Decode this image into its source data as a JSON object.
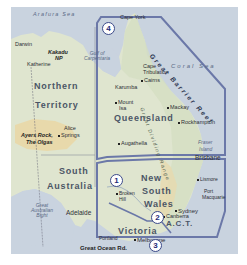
{
  "map": {
    "title": "Eastern & Central Australia regions",
    "colors": {
      "sea": "#c9d3df",
      "land": "#dfe5cf",
      "land_green": "#d2dcc2",
      "desert": "#ead7a4",
      "region_outline": "#6b78a8",
      "badge_text": "#1e2a78"
    },
    "seas": {
      "arafura": "Arafura Sea",
      "coral": "Coral Sea",
      "gulf": "Gulf of Carpentaria",
      "bight": "Great Australian Bight"
    },
    "states": {
      "nt_line1": "Northern",
      "nt_line2": "Territory",
      "qld": "Queensland",
      "sa_line1": "South",
      "sa_line2": "Australia",
      "nsw_line1": "New",
      "nsw_line2": "South",
      "nsw_line3": "Wales",
      "vic": "Victoria",
      "act": "A.C.T."
    },
    "cities": {
      "darwin": "Darwin",
      "katherine": "Katherine",
      "alice_springs_1": "Alice",
      "alice_springs_2": "Springs",
      "cape_york": "Cape York",
      "cape_tribulation_1": "Cape",
      "cape_tribulation_2": "Tribulation",
      "cairns": "Cairns",
      "karumba": "Karumba",
      "mount_isa_1": "Mount",
      "mount_isa_2": "Isa",
      "mackay": "Mackay",
      "rockhampton": "Rockhampton",
      "augathella": "Augathella",
      "fraser_island_1": "Fraser",
      "fraser_island_2": "Island",
      "brisbane": "Brisbane",
      "lismore": "Lismore",
      "port_macquarie_1": "Port",
      "port_macquarie_2": "Macquarie",
      "broken_hill_1": "Broken",
      "broken_hill_2": "Hill",
      "sydney": "Sydney",
      "canberra": "Canberra",
      "adelaide": "Adelaide",
      "portland": "Portland",
      "melbourne": "Melbourne"
    },
    "attractions": {
      "kakadu_1": "Kakadu",
      "kakadu_2": "NP",
      "ayers_rock_1": "Ayers Rock,",
      "ayers_rock_2": "The Olgas",
      "great_ocean_rd": "Great Ocean Rd."
    },
    "features": {
      "great_barrier_reef": "Great Barrier Reef",
      "great_dividing_range": "Great Dividing Range"
    },
    "regions": [
      {
        "number": "1",
        "name": "Outback NSW"
      },
      {
        "number": "2",
        "name": "Canberra / ACT"
      },
      {
        "number": "3",
        "name": "Victoria"
      },
      {
        "number": "4",
        "name": "Queensland"
      }
    ]
  }
}
